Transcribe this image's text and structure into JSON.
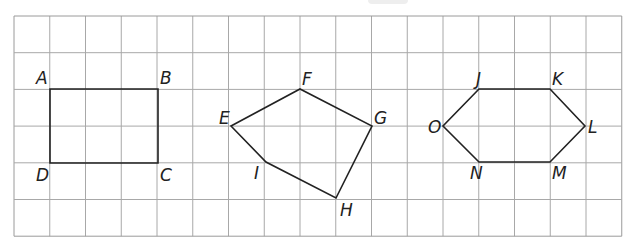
{
  "grid": {
    "left": 14,
    "top": 16,
    "cell_w": 35.75,
    "cell_h": 36.7,
    "cols": 17,
    "rows": 6,
    "line_color": "#a8a8a8",
    "border_color": "#9a9a9a"
  },
  "shape_stroke": "#222222",
  "shapes": [
    {
      "name": "rectangle-ABCD",
      "vertices": [
        {
          "label": "A",
          "x": 50,
          "y": 89,
          "lx": 36,
          "ly": 84
        },
        {
          "label": "B",
          "x": 158,
          "y": 89,
          "lx": 160,
          "ly": 84
        },
        {
          "label": "C",
          "x": 158,
          "y": 163,
          "lx": 160,
          "ly": 181
        },
        {
          "label": "D",
          "x": 50,
          "y": 163,
          "lx": 36,
          "ly": 181
        }
      ]
    },
    {
      "name": "pentagon-EFGHI",
      "vertices": [
        {
          "label": "E",
          "x": 231,
          "y": 126,
          "lx": 219,
          "ly": 124
        },
        {
          "label": "F",
          "x": 300,
          "y": 89,
          "lx": 302,
          "ly": 85
        },
        {
          "label": "G",
          "x": 372,
          "y": 126,
          "lx": 374,
          "ly": 124
        },
        {
          "label": "H",
          "x": 336,
          "y": 198,
          "lx": 340,
          "ly": 216
        },
        {
          "label": "I",
          "x": 266,
          "y": 162,
          "lx": 254,
          "ly": 179
        }
      ]
    },
    {
      "name": "hexagon-JKLMNO",
      "vertices": [
        {
          "label": "J",
          "x": 479,
          "y": 89,
          "lx": 476,
          "ly": 85
        },
        {
          "label": "K",
          "x": 550,
          "y": 89,
          "lx": 552,
          "ly": 85
        },
        {
          "label": "L",
          "x": 585,
          "y": 126,
          "lx": 588,
          "ly": 133
        },
        {
          "label": "M",
          "x": 550,
          "y": 162,
          "lx": 552,
          "ly": 179
        },
        {
          "label": "N",
          "x": 479,
          "y": 162,
          "lx": 470,
          "ly": 179
        },
        {
          "label": "O",
          "x": 443,
          "y": 126,
          "lx": 428,
          "ly": 133
        }
      ]
    }
  ]
}
